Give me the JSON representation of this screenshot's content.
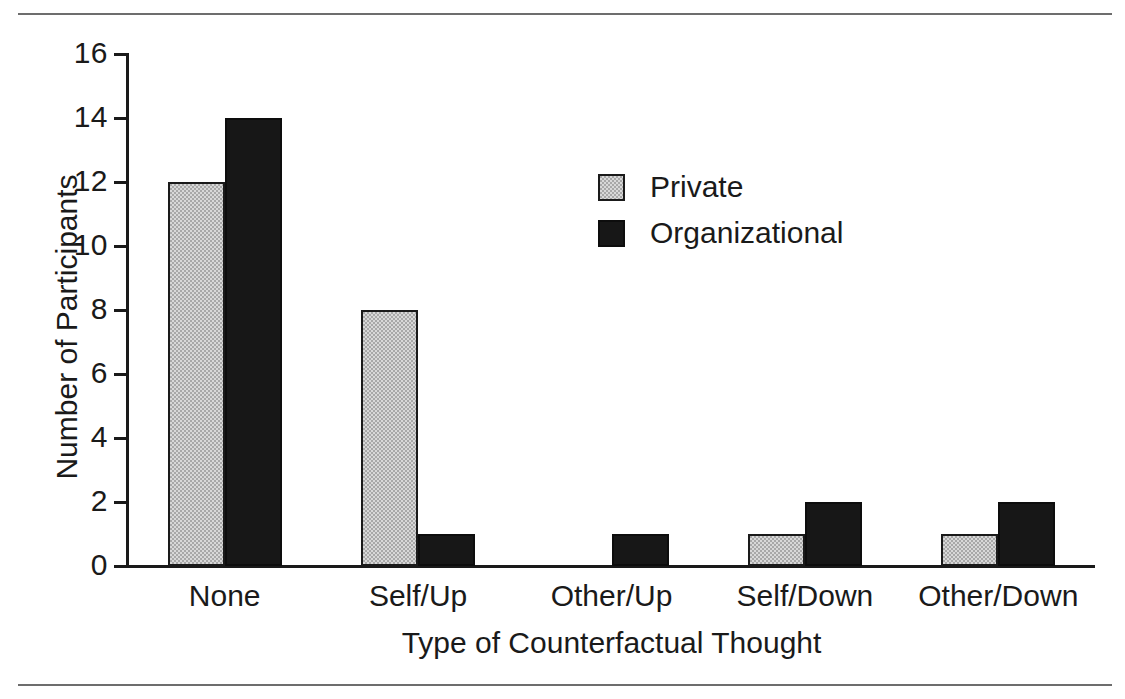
{
  "chart_data": {
    "type": "bar",
    "title": "",
    "subtitle": "",
    "xlabel": "Type of Counterfactual Thought",
    "ylabel": "Number of Participants",
    "categories": [
      "None",
      "Self/Up",
      "Other/Up",
      "Self/Down",
      "Other/Down"
    ],
    "series": [
      {
        "name": "Private",
        "values": [
          12,
          8,
          0,
          1,
          1
        ],
        "color": "#a8a8a8"
      },
      {
        "name": "Organizational",
        "values": [
          14,
          1,
          1,
          2,
          2
        ],
        "color": "#171717"
      }
    ],
    "ylim": [
      0,
      16
    ],
    "ytick_labels": [
      "0",
      "2",
      "4",
      "6",
      "8",
      "10",
      "12",
      "14",
      "16"
    ],
    "ytick_values": [
      0,
      2,
      4,
      6,
      8,
      10,
      12,
      14,
      16
    ],
    "ytick_step": 2,
    "grid": false,
    "legend_position": "upper-center",
    "legend_entries": [
      "Private",
      "Organizational"
    ],
    "annotations": []
  },
  "frame": {
    "rule_top": "horizontal-rule",
    "rule_bottom": "horizontal-rule"
  }
}
